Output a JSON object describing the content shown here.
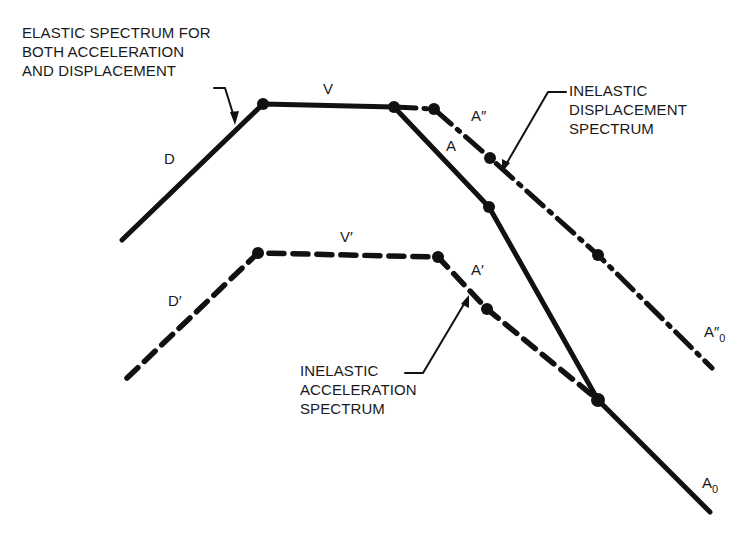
{
  "diagram": {
    "type": "response-spectrum-schematic",
    "annotations": {
      "elastic": "ELASTIC SPECTRUM FOR\nBOTH ACCELERATION\nAND DISPLACEMENT",
      "inelastic_displacement": "INELASTIC\nDISPLACEMENT\nSPECTRUM",
      "inelastic_acceleration": "INELASTIC\nACCELERATION\nSPECTRUM"
    },
    "symbols": {
      "D": "D",
      "V": "V",
      "A": "A",
      "A_double_prime": "A″",
      "D_prime": "D′",
      "V_prime": "V′",
      "A_prime": "A′",
      "A0_double_prime_base": "A″",
      "A0_double_prime_sub": "0",
      "A0_base": "A",
      "A0_sub": "0"
    },
    "curves": [
      {
        "name": "elastic",
        "style": "solid",
        "points": [
          [
            122,
            240
          ],
          [
            263,
            104
          ],
          [
            394,
            107
          ],
          [
            489,
            207
          ],
          [
            598,
            400
          ],
          [
            710,
            512
          ]
        ]
      },
      {
        "name": "inelastic-displacement",
        "style": "dash-dot",
        "points": [
          [
            394,
            107
          ],
          [
            434,
            109
          ],
          [
            490,
            158
          ],
          [
            598,
            255
          ],
          [
            712,
            368
          ]
        ]
      },
      {
        "name": "inelastic-acceleration",
        "style": "dashed",
        "points": [
          [
            127,
            378
          ],
          [
            258,
            253
          ],
          [
            438,
            257
          ],
          [
            487,
            309
          ],
          [
            598,
            400
          ]
        ]
      }
    ],
    "colors": {
      "line": "#111111",
      "background": "#ffffff"
    }
  }
}
